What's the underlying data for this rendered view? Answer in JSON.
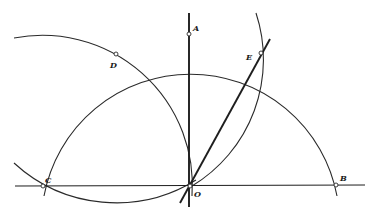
{
  "diagram": {
    "title": "",
    "stroke_color": "#2a2a2a",
    "background": "#ffffff",
    "points": [
      {
        "id": "O",
        "label": "O"
      },
      {
        "id": "A",
        "label": "A"
      },
      {
        "id": "B",
        "label": "B"
      },
      {
        "id": "C",
        "label": "C"
      },
      {
        "id": "D",
        "label": "D"
      },
      {
        "id": "E",
        "label": "E"
      }
    ],
    "segments": [
      {
        "id": "line-CB",
        "from": "C",
        "to": "B",
        "description": "horizontal line through C, O, B"
      },
      {
        "id": "line-OA",
        "from": "O",
        "to": "A",
        "description": "vertical line through O and A"
      },
      {
        "id": "line-OE",
        "from": "O",
        "to": "E",
        "description": "thick ray from O through E"
      }
    ],
    "arcs": [
      {
        "id": "arc-center-O",
        "center": "O",
        "through": [
          "C",
          "D",
          "A",
          "E",
          "B"
        ]
      },
      {
        "id": "arc-center-C",
        "center": "C",
        "through": [
          "D",
          "O"
        ]
      },
      {
        "id": "arc-center-D",
        "center": "D",
        "through": [
          "C",
          "O"
        ]
      },
      {
        "id": "arc-center-B",
        "center": "B",
        "through": [
          "E",
          "O"
        ]
      }
    ]
  }
}
